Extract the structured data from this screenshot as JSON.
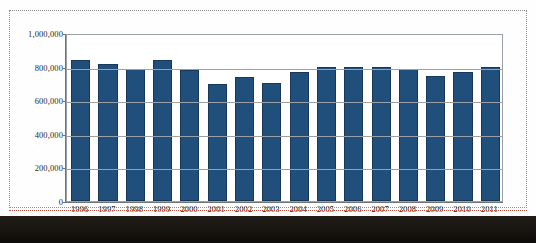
{
  "figure": {
    "frame_style": "dotted-selection",
    "bar_color": "#1f4f7a",
    "bar_border_color": "#16395a",
    "grid_color": "#9aa0a6",
    "axis_color": "#6f7479",
    "background": "#ffffff"
  },
  "chart_data": {
    "type": "bar",
    "title": "",
    "subtitle": "",
    "xlabel": "",
    "ylabel": "",
    "grid": true,
    "legend": false,
    "legend_position": "none",
    "ylim": [
      0,
      1000000
    ],
    "ytick_values": [
      0,
      200000,
      400000,
      600000,
      800000,
      1000000
    ],
    "ytick_labels": [
      "0",
      "200,000",
      "400,000",
      "600,000",
      "800,000",
      "1,000,000"
    ],
    "categories": [
      "1996",
      "1997",
      "1998",
      "1999",
      "2000",
      "2001",
      "2002",
      "2003",
      "2004",
      "2005",
      "2006",
      "2007",
      "2008",
      "2009",
      "2010",
      "2011"
    ],
    "values": [
      840000,
      815000,
      785000,
      840000,
      780000,
      695000,
      740000,
      705000,
      770000,
      800000,
      798000,
      798000,
      788000,
      742000,
      770000,
      800000
    ]
  }
}
